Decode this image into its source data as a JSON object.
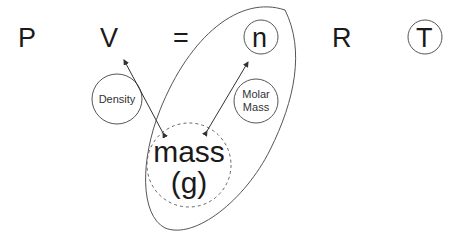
{
  "equation": {
    "terms": [
      "P",
      "V",
      "=",
      "n",
      "R",
      "T"
    ],
    "circled_terms": [
      "n",
      "T"
    ]
  },
  "nodes": {
    "density": {
      "label": "Density"
    },
    "molar_mass": {
      "label_line1": "Molar",
      "label_line2": "Mass"
    },
    "mass": {
      "label_line1": "mass",
      "label_line2": "(g)"
    }
  },
  "relations": [
    {
      "from": "mass",
      "to": "V",
      "via": "Density"
    },
    {
      "from": "mass",
      "to": "n",
      "via": "Molar Mass"
    }
  ],
  "colors": {
    "line": "#555555",
    "text": "#1a1a1a"
  }
}
